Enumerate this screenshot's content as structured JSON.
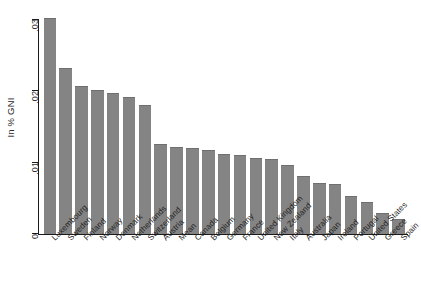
{
  "chart_data": {
    "type": "bar",
    "title": "",
    "subtitle": "",
    "xlabel": "",
    "ylabel": "In % GNI",
    "ylim": [
      0,
      0.0315
    ],
    "yticks": [
      0,
      0.01,
      0.02,
      0.03
    ],
    "ytick_labels": [
      "0",
      ".01",
      ".02",
      ".03"
    ],
    "grid": false,
    "legend": null,
    "bar_color": "#848484",
    "axis_color": "#1a1a1a",
    "categories": [
      "Luxembourg",
      "Sweden",
      "Finland",
      "Norway",
      "Denmark",
      "Netherlands",
      "Switzerland",
      "Austria",
      "Mean",
      "Canada",
      "Belgium",
      "Germany",
      "France",
      "United Kingdom",
      "New Zealand",
      "Italy",
      "Australia",
      "Japan",
      "Ireland",
      "Portugal",
      "United States",
      "Greece",
      "Spain"
    ],
    "values": [
      0.0302,
      0.0232,
      0.0207,
      0.0201,
      0.0197,
      0.0192,
      0.018,
      0.0126,
      0.0122,
      0.012,
      0.0118,
      0.0112,
      0.0111,
      0.0107,
      0.0105,
      0.0096,
      0.0081,
      0.0072,
      0.007,
      0.0053,
      0.0045,
      0.0029,
      0.0021
    ]
  }
}
